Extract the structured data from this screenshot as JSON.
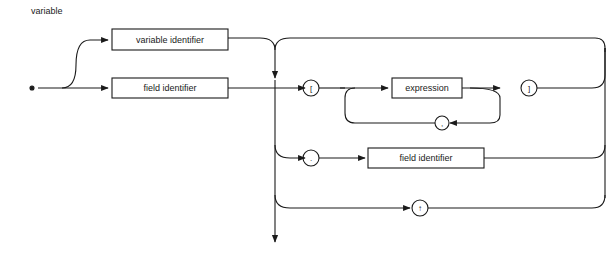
{
  "diagram": {
    "title": "variable",
    "type": "syntax-diagram",
    "nodes": {
      "variable_identifier": "variable identifier",
      "field_identifier_1": "field identifier",
      "expression": "expression",
      "field_identifier_2": "field identifier"
    },
    "symbols": {
      "open_bracket": "[",
      "close_bracket": "]",
      "comma": ",",
      "period": ".",
      "up_arrow": "↑"
    }
  }
}
